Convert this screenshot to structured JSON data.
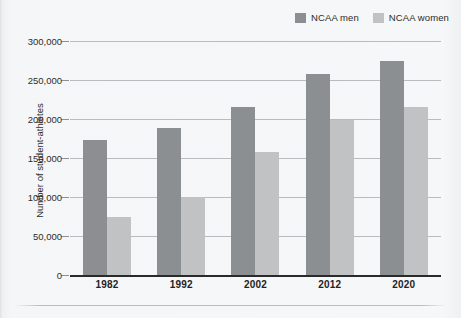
{
  "legend": {
    "position": "top-right",
    "items": [
      {
        "label": "NCAA men",
        "color": "#8c8f91",
        "icon": "legend-swatch-icon"
      },
      {
        "label": "NCAA women",
        "color": "#c1c2c4",
        "icon": "legend-swatch-icon"
      }
    ]
  },
  "axes": {
    "y_title": "Number of student-athletes",
    "y_ticks": [
      "0",
      "50,000",
      "100,000",
      "150,000",
      "200,000",
      "250,000",
      "300,000"
    ],
    "x_ticks": [
      "1982",
      "1992",
      "2002",
      "2012",
      "2020"
    ]
  },
  "colors": {
    "men": "#8c8f91",
    "women": "#c1c2c4",
    "gridline": "#b9bcbe",
    "axis": "#2a2a2a",
    "background": "#f4f5f6",
    "text": "#2b2b2b"
  },
  "chart_data": {
    "type": "bar",
    "title": "",
    "subtitle": "",
    "xlabel": "",
    "ylabel": "Number of student-athletes",
    "categories": [
      "1982",
      "1992",
      "2002",
      "2012",
      "2020"
    ],
    "series": [
      {
        "name": "NCAA men",
        "color": "#8c8f91",
        "values": [
          173000,
          189000,
          215000,
          258000,
          275000
        ]
      },
      {
        "name": "NCAA women",
        "color": "#c1c2c4",
        "values": [
          75000,
          100000,
          158000,
          199000,
          215000
        ]
      }
    ],
    "ylim": [
      0,
      300000
    ],
    "ytick_step": 50000,
    "grid": true,
    "legend_position": "top-right"
  }
}
